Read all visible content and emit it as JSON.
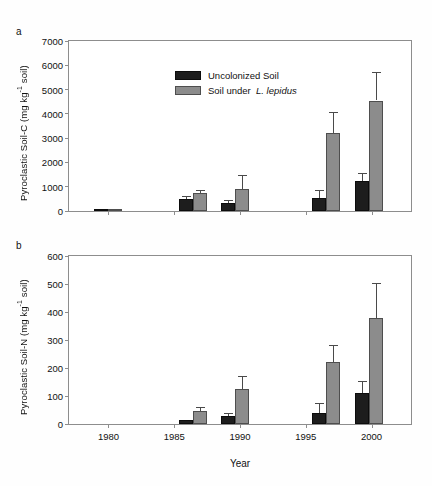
{
  "figure": {
    "xlabel": "Year",
    "legend": [
      {
        "key": "uncolonized",
        "label": "Uncolonized Soil",
        "color": "#1d1d1d"
      },
      {
        "key": "lepidus",
        "label": "Soil under  L. lepidus",
        "color": "#8c8c8c"
      }
    ]
  },
  "panels": [
    {
      "letter": "a",
      "ylabel_pre": "Pyroclastic Soil-C (mg kg",
      "ylabel_sup": "-1",
      "ylabel_post": " soil)",
      "yticks": [
        "0",
        "1000",
        "2000",
        "3000",
        "4000",
        "5000",
        "6000",
        "7000"
      ]
    },
    {
      "letter": "b",
      "ylabel_pre": "Pyroclastic Soil-N (mg kg",
      "ylabel_sup": "-1",
      "ylabel_post": " soil)",
      "yticks": [
        "0",
        "100",
        "200",
        "300",
        "400",
        "500",
        "600"
      ]
    }
  ],
  "xticks": [
    "1980",
    "1985",
    "1990",
    "1995",
    "2000"
  ],
  "chart_data": [
    {
      "type": "bar",
      "panel": "a",
      "title": "Pyroclastic Soil-C",
      "xlabel": "Year",
      "ylabel": "Pyroclastic Soil-C (mg kg-1 soil)",
      "ylim": [
        0,
        7000
      ],
      "ytick_step": 1000,
      "xlim": [
        1977,
        2003
      ],
      "xticks": [
        1980,
        1985,
        1990,
        1995,
        2000
      ],
      "grid": false,
      "legend_position": "upper-left-inside",
      "categories": [
        "1980",
        "1986",
        "1989",
        "1996",
        "1999"
      ],
      "group_centers": [
        1980.0,
        1986.4,
        1989.6,
        1996.5,
        1999.8
      ],
      "series": [
        {
          "name": "Uncolonized Soil",
          "color": "#1d1d1d",
          "values": [
            15,
            500,
            340,
            520,
            1230
          ],
          "errors": [
            0,
            130,
            120,
            340,
            320
          ]
        },
        {
          "name": "Soil under L. lepidus",
          "color": "#8c8c8c",
          "values": [
            15,
            730,
            920,
            3200,
            4550
          ],
          "errors": [
            0,
            150,
            580,
            880,
            1180
          ]
        }
      ]
    },
    {
      "type": "bar",
      "panel": "b",
      "title": "Pyroclastic Soil-N",
      "xlabel": "Year",
      "ylabel": "Pyroclastic Soil-N (mg kg-1 soil)",
      "ylim": [
        0,
        600
      ],
      "ytick_step": 100,
      "xlim": [
        1977,
        2003
      ],
      "xticks": [
        1980,
        1985,
        1990,
        1995,
        2000
      ],
      "grid": false,
      "legend_position": "none",
      "categories": [
        "1980",
        "1986",
        "1989",
        "1996",
        "1999"
      ],
      "group_centers": [
        1980.0,
        1986.4,
        1989.6,
        1996.5,
        1999.8
      ],
      "series": [
        {
          "name": "Uncolonized Soil",
          "color": "#1d1d1d",
          "values": [
            0,
            14,
            28,
            38,
            110
          ],
          "errors": [
            0,
            0,
            13,
            38,
            42
          ]
        },
        {
          "name": "Soil under L. lepidus",
          "color": "#8c8c8c",
          "values": [
            0,
            48,
            125,
            223,
            380
          ],
          "errors": [
            0,
            14,
            48,
            60,
            125
          ]
        }
      ]
    }
  ]
}
